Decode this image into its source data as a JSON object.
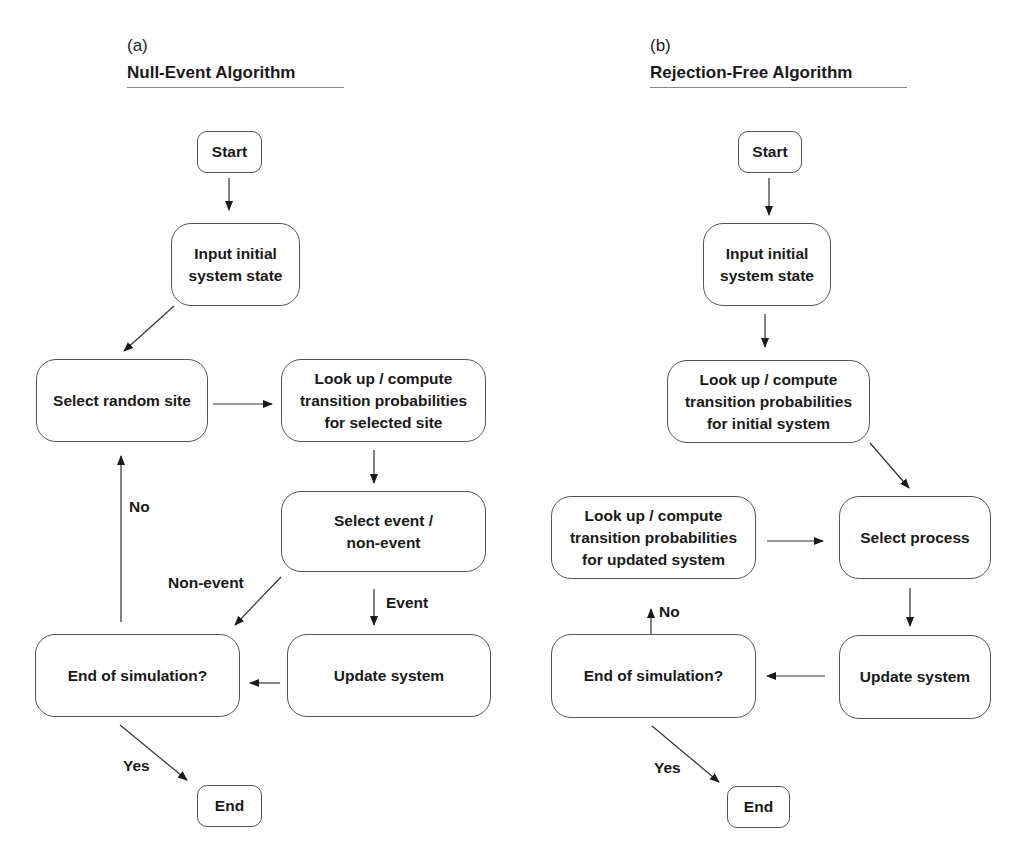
{
  "panels": [
    {
      "letter": "(a)",
      "title": "Null-Event Algorithm",
      "nodes": {
        "start": "Start",
        "input": "Input initial\nsystem state",
        "select_site": "Select random site",
        "lookup": "Look up / compute\ntransition probabilities\nfor selected site",
        "select_event": "Select event /\nnon-event",
        "update": "Update system",
        "end_sim": "End of simulation?",
        "end": "End"
      },
      "edge_labels": {
        "no": "No",
        "non_event": "Non-event",
        "event": "Event",
        "yes": "Yes"
      }
    },
    {
      "letter": "(b)",
      "title": "Rejection-Free Algorithm",
      "nodes": {
        "start": "Start",
        "input": "Input initial\nsystem state",
        "lookup_initial": "Look up / compute\ntransition probabilities\nfor initial system",
        "lookup_updated": "Look up / compute\ntransition probabilities\nfor updated system",
        "select_process": "Select process",
        "update": "Update system",
        "end_sim": "End of simulation?",
        "end": "End"
      },
      "edge_labels": {
        "no": "No",
        "yes": "Yes"
      }
    }
  ],
  "colors": {
    "stroke": "#555555",
    "text": "#1a1a1a",
    "background": "#ffffff"
  }
}
